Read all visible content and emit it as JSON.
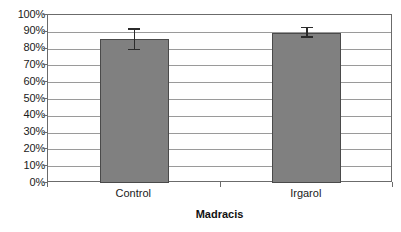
{
  "chart_data": {
    "type": "bar",
    "title": "",
    "subtitle": "",
    "xlabel": "Madracis",
    "ylabel": "",
    "categories": [
      "Control",
      "Irgarol"
    ],
    "values": [
      86,
      89.5
    ],
    "errors_low": [
      79,
      86.5
    ],
    "errors_high": [
      92,
      93
    ],
    "ylim": [
      0,
      100
    ],
    "ytick_labels": [
      "100%",
      "90%",
      "80%",
      "70%",
      "60%",
      "50%",
      "40%",
      "30%",
      "20%",
      "10%",
      "0%"
    ],
    "ytick_values": [
      100,
      90,
      80,
      70,
      60,
      50,
      40,
      30,
      20,
      10,
      0
    ],
    "grid": true,
    "legend": false,
    "legend_position": "none",
    "bar_color": "#808080",
    "bar_border_color": "#4a4a4a",
    "error_bar_color": "#2b2b2b",
    "gridline_color": "#9a9a9a",
    "frame_color": "#6b6b6b",
    "background_color": "#ffffff",
    "value_unit": "%"
  }
}
